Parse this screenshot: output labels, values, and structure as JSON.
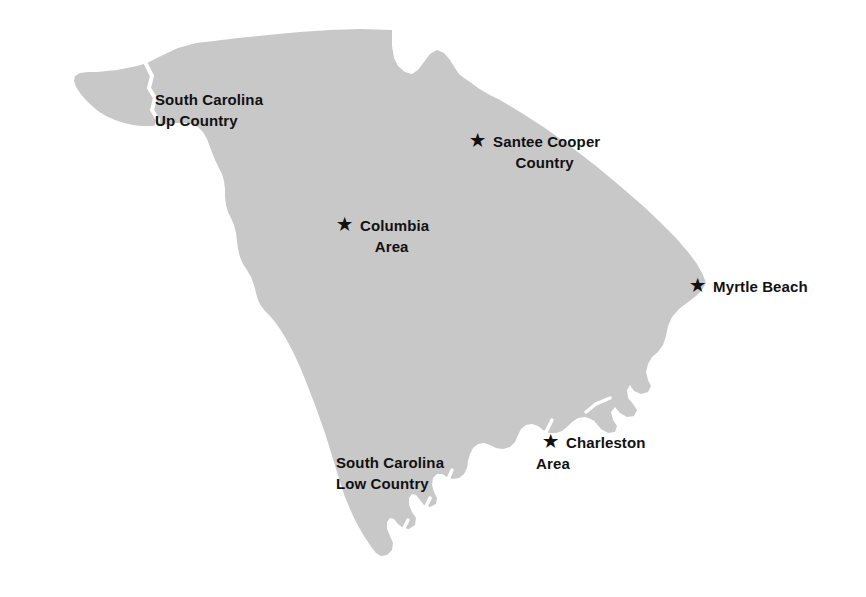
{
  "map": {
    "title": "South Carolina Tourism Regions",
    "subject": "South Carolina",
    "background_color": "#ffffff",
    "state_fill_color": "#c8c8c8",
    "label_color": "#111111",
    "star_glyph": "★",
    "regions": [
      {
        "id": "up-country",
        "line1": "South Carolina",
        "line2": "Up Country"
      },
      {
        "id": "low-country",
        "line1": "South Carolina",
        "line2": "Low Country"
      }
    ],
    "cities": [
      {
        "id": "santee-cooper",
        "line1": "Santee Cooper",
        "line2": "Country",
        "marker": "★"
      },
      {
        "id": "columbia",
        "line1": "Columbia",
        "line2": "Area",
        "marker": "★"
      },
      {
        "id": "myrtle-beach",
        "line1": "Myrtle Beach",
        "line2": "",
        "marker": "★"
      },
      {
        "id": "charleston",
        "line1": "Charleston",
        "line2": "Area",
        "marker": "★"
      }
    ]
  }
}
